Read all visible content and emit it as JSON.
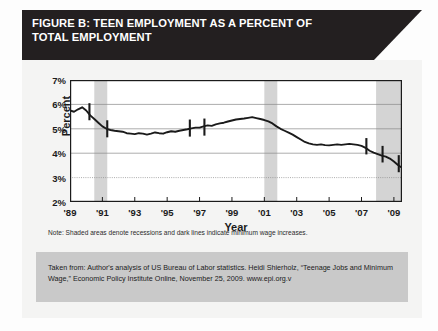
{
  "figure": {
    "banner_title": "FIGURE B: TEEN EMPLOYMENT AS A PERCENT OF\nTOTAL EMPLOYMENT",
    "note": "Note: Shaded areas denote recessions and dark lines indicate minimum wage increases.",
    "citation": "Taken from: Author's analysis of US Bureau of Labor statistics. Heidi Shierholz, “Teenage Jobs and Minimum Wage,” Economic Policy Institute Online, November 25, 2009. www.epi.org.v"
  },
  "colors": {
    "banner_bg": "#231f20",
    "banner_text": "#ffffff",
    "card_bg": "#f4f4f3",
    "plot_bg": "#ffffff",
    "line": "#1a1a1a",
    "recession_shade": "#d4d4d4",
    "gridline": "#8a8a8a",
    "cite_bg": "#c9c9c9",
    "axis": "#1b1b1b"
  },
  "chart_data": {
    "type": "line",
    "title": "FIGURE B: TEEN EMPLOYMENT AS A PERCENT OF TOTAL EMPLOYMENT",
    "xlabel": "Year",
    "ylabel": "Percent",
    "xlim": [
      1989,
      2009.5
    ],
    "ylim": [
      2,
      7
    ],
    "yticks": [
      2,
      3,
      4,
      5,
      6,
      7
    ],
    "ytick_labels": [
      "2%",
      "3%",
      "4%",
      "5%",
      "6%",
      "7%"
    ],
    "xticks": [
      1989,
      1991,
      1993,
      1995,
      1997,
      1999,
      2001,
      2003,
      2005,
      2007,
      2009
    ],
    "xtick_labels": [
      "'89",
      "'91",
      "'93",
      "'95",
      "'97",
      "'99",
      "'01",
      "'03",
      "'05",
      "'07",
      "'09"
    ],
    "grid": true,
    "legend": false,
    "series": [
      {
        "name": "Teen employment as percent of total employment",
        "x": [
          1989.0,
          1989.25,
          1989.5,
          1989.75,
          1990.0,
          1990.25,
          1990.5,
          1990.75,
          1991.0,
          1991.25,
          1991.5,
          1991.75,
          1992.0,
          1992.25,
          1992.5,
          1992.75,
          1993.0,
          1993.25,
          1993.5,
          1993.75,
          1994.0,
          1994.25,
          1994.5,
          1994.75,
          1995.0,
          1995.25,
          1995.5,
          1995.75,
          1996.0,
          1996.25,
          1996.5,
          1996.75,
          1997.0,
          1997.25,
          1997.5,
          1997.75,
          1998.0,
          1998.25,
          1998.5,
          1998.75,
          1999.0,
          1999.25,
          1999.5,
          1999.75,
          2000.0,
          2000.25,
          2000.5,
          2000.75,
          2001.0,
          2001.25,
          2001.5,
          2001.75,
          2002.0,
          2002.25,
          2002.5,
          2002.75,
          2003.0,
          2003.25,
          2003.5,
          2003.75,
          2004.0,
          2004.25,
          2004.5,
          2004.75,
          2005.0,
          2005.25,
          2005.5,
          2005.75,
          2006.0,
          2006.25,
          2006.5,
          2006.75,
          2007.0,
          2007.25,
          2007.5,
          2007.75,
          2008.0,
          2008.25,
          2008.5,
          2008.75,
          2009.0,
          2009.25,
          2009.5
        ],
        "values": [
          5.75,
          5.7,
          5.8,
          5.88,
          5.75,
          5.55,
          5.4,
          5.25,
          5.1,
          5.0,
          4.95,
          4.92,
          4.9,
          4.88,
          4.82,
          4.8,
          4.78,
          4.82,
          4.8,
          4.76,
          4.8,
          4.85,
          4.82,
          4.8,
          4.86,
          4.9,
          4.88,
          4.92,
          4.95,
          4.98,
          5.02,
          5.05,
          5.05,
          5.1,
          5.14,
          5.12,
          5.18,
          5.22,
          5.25,
          5.3,
          5.34,
          5.38,
          5.4,
          5.42,
          5.45,
          5.48,
          5.44,
          5.4,
          5.36,
          5.3,
          5.22,
          5.1,
          5.0,
          4.92,
          4.84,
          4.76,
          4.66,
          4.56,
          4.46,
          4.4,
          4.36,
          4.34,
          4.36,
          4.33,
          4.32,
          4.34,
          4.36,
          4.34,
          4.36,
          4.38,
          4.36,
          4.34,
          4.3,
          4.22,
          4.1,
          4.02,
          3.96,
          3.9,
          3.86,
          3.78,
          3.66,
          3.52,
          3.4
        ]
      }
    ],
    "recession_bands": [
      {
        "start": 1990.5,
        "end": 1991.3,
        "label": "1990-91 recession"
      },
      {
        "start": 2001.0,
        "end": 2001.8,
        "label": "2001 recession"
      },
      {
        "start": 2007.9,
        "end": 2009.5,
        "label": "2007-09 recession"
      }
    ],
    "minimum_wage_markers": [
      {
        "x": 1990.2,
        "y_top": 6.05,
        "y_bottom": 5.35,
        "label": "min wage increase 1990"
      },
      {
        "x": 1991.3,
        "y_top": 5.35,
        "y_bottom": 4.65,
        "label": "min wage increase 1991"
      },
      {
        "x": 1996.4,
        "y_top": 5.38,
        "y_bottom": 4.68,
        "label": "min wage increase 1996"
      },
      {
        "x": 1997.3,
        "y_top": 5.42,
        "y_bottom": 4.72,
        "label": "min wage increase 1997"
      },
      {
        "x": 2007.3,
        "y_top": 4.62,
        "y_bottom": 3.95,
        "label": "min wage increase 2007"
      },
      {
        "x": 2008.3,
        "y_top": 4.3,
        "y_bottom": 3.62,
        "label": "min wage increase 2008"
      },
      {
        "x": 2009.3,
        "y_top": 3.92,
        "y_bottom": 3.22,
        "label": "min wage increase 2009"
      }
    ]
  }
}
